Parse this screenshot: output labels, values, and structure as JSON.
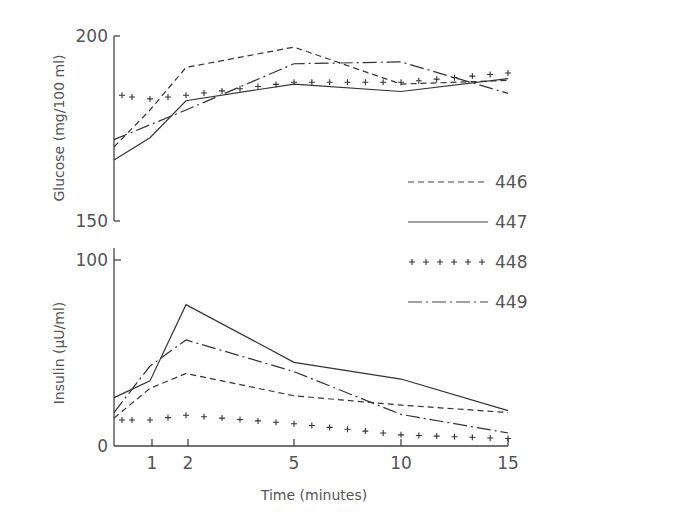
{
  "chart_data": [
    {
      "type": "line",
      "panel": "top",
      "ylabel": "Glucose (mg/100 ml)",
      "ylim": [
        150,
        200
      ],
      "yticks": [
        "150",
        "200"
      ],
      "x": [
        0,
        1,
        2,
        5,
        10,
        15
      ],
      "series": [
        {
          "name": "446",
          "style": "dashed",
          "values": [
            170,
            180,
            191.5,
            197,
            187,
            188
          ]
        },
        {
          "name": "447",
          "style": "solid",
          "values": [
            166.5,
            172.5,
            182.5,
            187,
            185,
            188.5
          ]
        },
        {
          "name": "448",
          "style": "plus-markers",
          "values": [
            184,
            183,
            184,
            187.5,
            187.5,
            190
          ]
        },
        {
          "name": "449",
          "style": "dash-dot",
          "values": [
            172,
            176,
            180,
            192.5,
            193,
            184.5
          ]
        }
      ]
    },
    {
      "type": "line",
      "panel": "bottom",
      "ylabel": "Insulin (μU/ml)",
      "xlabel": "Time (minutes)",
      "ylim": [
        0,
        100
      ],
      "yticks": [
        "0",
        "100"
      ],
      "xticks": [
        "1",
        "2",
        "5",
        "10",
        "15"
      ],
      "x": [
        0,
        1,
        2,
        5,
        10,
        15
      ],
      "series": [
        {
          "name": "446",
          "style": "dashed",
          "values": [
            15,
            31,
            39,
            27,
            22,
            18
          ]
        },
        {
          "name": "447",
          "style": "solid",
          "values": [
            26,
            35,
            76,
            45,
            36,
            19
          ]
        },
        {
          "name": "448",
          "style": "plus-markers",
          "values": [
            14,
            14,
            16.5,
            12,
            6,
            4
          ]
        },
        {
          "name": "449",
          "style": "dash-dot",
          "values": [
            18,
            43,
            57,
            40,
            17,
            7
          ]
        }
      ]
    }
  ],
  "labels": {
    "glucose_axis": "Glucose (mg/100 ml)",
    "insulin_axis": "Insulin (μU/ml)",
    "time_axis": "Time (minutes)",
    "glucose_ticks": [
      "200",
      "150"
    ],
    "insulin_ticks": [
      "100",
      "0"
    ],
    "time_ticks": [
      "1",
      "2",
      "5",
      "10",
      "15"
    ]
  },
  "legend": [
    {
      "label": "446",
      "style": "dashed"
    },
    {
      "label": "447",
      "style": "solid"
    },
    {
      "label": "448",
      "style": "plus-markers"
    },
    {
      "label": "449",
      "style": "dash-dot"
    }
  ],
  "colors": {
    "ink": "#333333",
    "text": "#555555",
    "background": "#ffffff"
  }
}
